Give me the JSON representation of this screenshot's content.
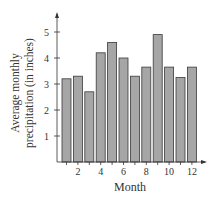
{
  "chart_data": {
    "type": "bar",
    "title": "",
    "xlabel": "Month",
    "ylabel": "Average monthly precipitation (in inches)",
    "ylabel_lines": [
      "Average monthly",
      "precipitation (in inches)"
    ],
    "categories": [
      1,
      2,
      3,
      4,
      5,
      6,
      7,
      8,
      9,
      10,
      11,
      12
    ],
    "values": [
      3.2,
      3.3,
      2.7,
      4.2,
      4.6,
      4.0,
      3.3,
      3.65,
      4.9,
      3.65,
      3.25,
      3.65
    ],
    "x_tick_labels": [
      "2",
      "4",
      "6",
      "8",
      "10",
      "12"
    ],
    "y_tick_labels": [
      "1",
      "2",
      "3",
      "4",
      "5"
    ],
    "ylim": [
      0,
      5.5
    ],
    "grid": false,
    "legend": null,
    "colors": {
      "bar_fill": "#a6a6a6",
      "bar_stroke": "#3a3a3a",
      "axis": "#333333"
    }
  }
}
